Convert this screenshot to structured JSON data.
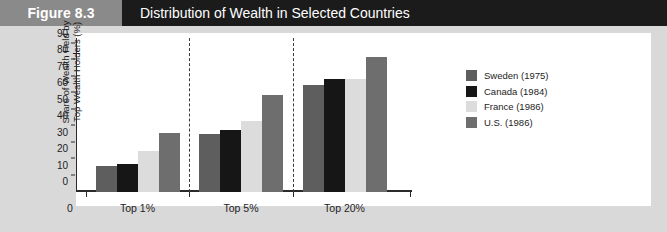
{
  "header": {
    "figure_number": "Figure 8.3",
    "title": "Distribution of Wealth in Selected Countries",
    "band_color": "#1b1b1b",
    "number_block_color": "#8a8a8a"
  },
  "chart_data": {
    "type": "bar",
    "title": "Distribution of Wealth in Selected Countries",
    "xlabel": "",
    "ylabel": "Share of Wealth Held by Top Wealth Holders (%)",
    "categories": [
      "Top 1%",
      "Top 5%",
      "Top 20%"
    ],
    "ylim": [
      0,
      90
    ],
    "yticks": [
      0,
      10,
      20,
      30,
      40,
      50,
      60,
      70,
      80,
      90
    ],
    "ytick_labels": [
      "0",
      "10",
      "20",
      "30",
      "40",
      "50",
      "60",
      "70",
      "80",
      "90"
    ],
    "x_origin_label": "0",
    "grid": false,
    "legend_position": "right",
    "series": [
      {
        "name": "Sweden (1975)",
        "color": "#5e5e5e",
        "values": [
          16,
          35,
          65
        ]
      },
      {
        "name": "Canada (1984)",
        "color": "#161616",
        "values": [
          17,
          38,
          69
        ]
      },
      {
        "name": "France (1986)",
        "color": "#dcdcdc",
        "values": [
          25,
          43,
          69
        ]
      },
      {
        "name": "U.S. (1986)",
        "color": "#6e6e6e",
        "values": [
          36,
          59,
          82
        ]
      }
    ]
  }
}
